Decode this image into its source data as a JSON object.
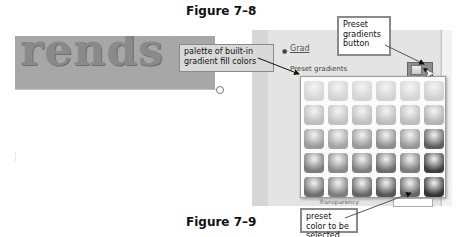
{
  "figures": {
    "top_caption": "Figure 7–8",
    "bottom_caption": "Figure 7–9"
  },
  "document": {
    "wordart_text": "rends"
  },
  "format_pane": {
    "gradient_fill_option": "Gradient fill",
    "gradient_fill_visible": "Grad",
    "preset_gradients_label": "Preset gradients",
    "transparency_label": "Transparency",
    "transparency_value": "0%"
  },
  "palette": {
    "rows": 5,
    "columns": 6,
    "swatch_colors": [
      [
        "#d6d6d6",
        "#d3d3d3",
        "#d4d4d4",
        "#d2d2d2",
        "#d5d5d5",
        "#cfcfcf"
      ],
      [
        "#bdbdbd",
        "#c2c2c2",
        "#bfbfbf",
        "#bcbcbc",
        "#bdbdbd",
        "#b3b3b3"
      ],
      [
        "#9a9a9a",
        "#a4a4a4",
        "#999999",
        "#8d8d8d",
        "#979797",
        "#5f5f5f"
      ],
      [
        "#7b7b7b",
        "#898989",
        "#7e7e7e",
        "#6b6b6b",
        "#7a7a7a",
        "#3f3f3f"
      ],
      [
        "#6d6d6d",
        "#7c7c7c",
        "#666666",
        "#555555",
        "#676767",
        "#353535"
      ]
    ]
  },
  "callouts": {
    "palette": "palette of built-in gradient fill colors",
    "preset_button": "Preset gradients button",
    "preset_color": "preset color to be selected"
  }
}
